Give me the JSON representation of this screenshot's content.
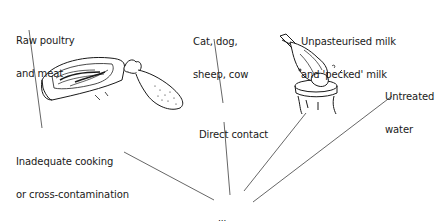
{
  "diagram": {
    "title": "",
    "nodes": [
      {
        "id": "raw",
        "line1": "Raw poultry",
        "line2": "and meat"
      },
      {
        "id": "animals",
        "line1": "Cat, dog,",
        "line2": "sheep, cow"
      },
      {
        "id": "milk",
        "line1": "Unpasteurised milk",
        "line2": "and 'pecked' milk"
      },
      {
        "id": "water",
        "line1": "Untreated",
        "line2": "water"
      },
      {
        "id": "direct",
        "line1": "Direct contact"
      },
      {
        "id": "cooking",
        "line1": "Inadequate cooking",
        "line2": "or cross-contamination"
      },
      {
        "id": "illness",
        "line1": "Illness"
      }
    ],
    "edges": [
      {
        "from": "raw",
        "to": "cooking"
      },
      {
        "from": "animals",
        "to": "direct"
      },
      {
        "from": "cooking",
        "to": "illness"
      },
      {
        "from": "direct",
        "to": "illness"
      },
      {
        "from": "milk",
        "to": "illness"
      },
      {
        "from": "water",
        "to": "illness"
      }
    ],
    "illustrations": [
      "meat-steak-and-chicken-drumstick",
      "bird-pecking-milk-bottle"
    ],
    "line_color": "#555555",
    "ink_color": "#1a1a1a"
  }
}
